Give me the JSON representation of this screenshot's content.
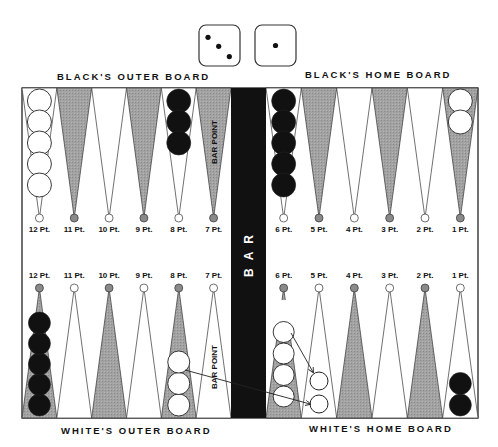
{
  "dice": [
    {
      "value": 3,
      "name": "die-three"
    },
    {
      "value": 1,
      "name": "die-one"
    }
  ],
  "board_labels": {
    "top_left": "BLACK'S OUTER BOARD",
    "top_right": "BLACK'S HOME BOARD",
    "bottom_left": "WHITE'S OUTER BOARD",
    "bottom_right": "WHITE'S HOME BOARD",
    "bar": "BAR",
    "bar_point": "BAR POINT"
  },
  "colors": {
    "dark_point": "#9a9a9a",
    "light_point": "#ffffff",
    "bar": "#111111",
    "black_checker": "#111111",
    "white_checker": "#ffffff",
    "outline": "#333333"
  },
  "top_points": [
    {
      "label": "12 Pt.",
      "shade": "light",
      "checkers": {
        "color": "white",
        "count": 5
      }
    },
    {
      "label": "11 Pt.",
      "shade": "dark",
      "checkers": null
    },
    {
      "label": "10 Pt.",
      "shade": "light",
      "checkers": null
    },
    {
      "label": "9 Pt.",
      "shade": "dark",
      "checkers": null
    },
    {
      "label": "8 Pt.",
      "shade": "light",
      "checkers": {
        "color": "black",
        "count": 3
      }
    },
    {
      "label": "7 Pt.",
      "shade": "dark",
      "checkers": null,
      "annotation": "BAR POINT"
    },
    {
      "label": "6 Pt.",
      "shade": "light",
      "checkers": {
        "color": "black",
        "count": 5
      }
    },
    {
      "label": "5 Pt.",
      "shade": "dark",
      "checkers": null
    },
    {
      "label": "4 Pt.",
      "shade": "light",
      "checkers": null
    },
    {
      "label": "3 Pt.",
      "shade": "dark",
      "checkers": null
    },
    {
      "label": "2 Pt.",
      "shade": "light",
      "checkers": null
    },
    {
      "label": "1 Pt.",
      "shade": "dark",
      "checkers": {
        "color": "white",
        "count": 2
      }
    }
  ],
  "bottom_points": [
    {
      "label": "12 Pt.",
      "shade": "dark",
      "checkers": {
        "color": "black",
        "count": 5
      }
    },
    {
      "label": "11 Pt.",
      "shade": "light",
      "checkers": null
    },
    {
      "label": "10 Pt.",
      "shade": "dark",
      "checkers": null
    },
    {
      "label": "9 Pt.",
      "shade": "light",
      "checkers": null
    },
    {
      "label": "8 Pt.",
      "shade": "dark",
      "checkers": {
        "color": "white",
        "count": 3
      }
    },
    {
      "label": "7 Pt.",
      "shade": "light",
      "checkers": null,
      "annotation": "BAR POINT"
    },
    {
      "label": "6 Pt.",
      "shade": "dark",
      "checkers": {
        "color": "white",
        "count": 4,
        "ghost": 1
      }
    },
    {
      "label": "5 Pt.",
      "shade": "light",
      "checkers": {
        "color": "outline",
        "count": 2
      }
    },
    {
      "label": "4 Pt.",
      "shade": "dark",
      "checkers": null
    },
    {
      "label": "3 Pt.",
      "shade": "light",
      "checkers": null
    },
    {
      "label": "2 Pt.",
      "shade": "dark",
      "checkers": null
    },
    {
      "label": "1 Pt.",
      "shade": "light",
      "checkers": {
        "color": "black",
        "count": 2
      }
    }
  ],
  "moves": [
    {
      "from": "White 8 Pt.",
      "to": "White 5 Pt."
    },
    {
      "from": "White 6 Pt.",
      "to": "White 5 Pt."
    }
  ]
}
